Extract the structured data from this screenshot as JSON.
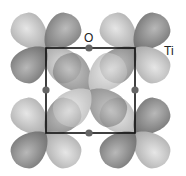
{
  "diagram": {
    "labels": {
      "oxygen": "O",
      "titanium": "Ti"
    },
    "colors": {
      "lobe_dark": "#7a7a7a",
      "lobe_light": "#c8c8c8",
      "cell": "#111111",
      "oxygen_atom": "#666666"
    },
    "cell": {
      "x1": 46,
      "y1": 48,
      "x2": 135,
      "y2": 133
    }
  }
}
